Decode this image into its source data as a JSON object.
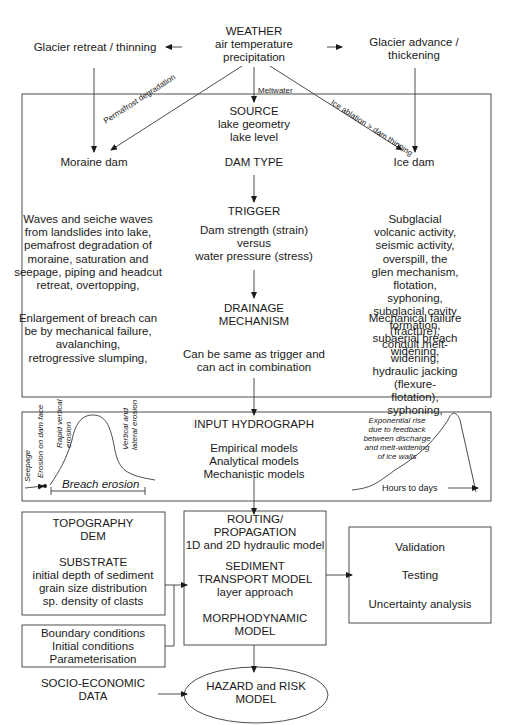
{
  "weather": {
    "title": "WEATHER",
    "lines": [
      "air temperature",
      "precipitation"
    ]
  },
  "glacier_retreat": "Glacier retreat / thinning",
  "glacier_advance": "Glacier advance /\nthickening",
  "arrow_labels": {
    "meltwater": "Meltwater",
    "permafrost": "Permafrost degradation",
    "ice_ablation": "Ice ablation > dam thinning"
  },
  "source_box": {
    "source_title": "SOURCE",
    "source_lines": "lake geometry\nlake level",
    "moraine_dam": "Moraine dam",
    "dam_type": "DAM TYPE",
    "ice_dam": "Ice dam",
    "trigger_title": "TRIGGER",
    "trigger_text": "Dam strength (strain)\nversus\nwater pressure (stress)",
    "moraine_triggers": "Waves and seiche waves\nfrom landslides into lake,\npemafrost degradation of\nmoraine, saturation and\nseepage, piping and headcut\nretreat, overtopping,",
    "ice_triggers": "Subglacial volcanic activity,\nseismic activity, overspill, the\nglen mechanism, flotation,\nsyphoning, subglacial cavity\nformation, subaerial breach\nwidening,",
    "drainage_title": "DRAINAGE\nMECHANISM",
    "drainage_text": "Can be same as trigger and\ncan act in combination",
    "moraine_drainage": "Enlargement of breach can\nbe by mechanical failure,\navalanching,\nretrogressive slumping,",
    "ice_drainage": "Mechanical failure (fracture),\nconduit melt-widening,\nhydraulic jacking (flexure-\nflotation), syphoning,"
  },
  "hydrograph_box": {
    "title": "INPUT HYDROGRAPH",
    "models": "Empirical models\nAnalytical models\nMechanistic models",
    "left_curve": {
      "seepage": "Seepage",
      "erosion_face": "Erosion on dam face",
      "rapid_vertical": "Rapid vertical\nerosion",
      "vertical_lateral": "Vertical and\nlateral erosion",
      "breach_erosion": "Breach erosion"
    },
    "right_curve": {
      "note": "Exponential rise\ndue to feedback\nbetween discharge\nand melt-widening\nof ice walls",
      "time_label": "Hours to days"
    }
  },
  "topography_box": {
    "title": "TOPOGRAPHY\nDEM",
    "substrate_title": "SUBSTRATE",
    "substrate_lines": "initial depth of sediment\ngrain size distribution\nsp. density of clasts"
  },
  "conditions_box": {
    "lines": "Boundary conditions\nInitial conditions\nParameterisation"
  },
  "routing_box": {
    "title": "ROUTING/\nPROPAGATION",
    "hydraulic": "1D and 2D hydraulic model",
    "sediment_title": "SEDIMENT\nTRANSPORT MODEL",
    "sediment_sub": "layer approach",
    "morpho": "MORPHODYNAMIC\nMODEL"
  },
  "validation_box": {
    "items": [
      "Validation",
      "Testing",
      "Uncertainty analysis"
    ]
  },
  "socio_economic": "SOCIO-ECONOMIC\nDATA",
  "hazard_model": "HAZARD and RISK\nMODEL"
}
